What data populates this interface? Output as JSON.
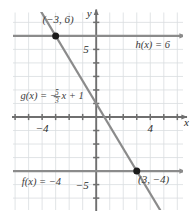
{
  "figure": {
    "axis_labels": {
      "x": "x",
      "y": "y"
    },
    "x_ticks": [
      {
        "value": -4,
        "label": "−4"
      },
      {
        "value": 4,
        "label": "4"
      }
    ],
    "y_ticks": [
      {
        "value": 5,
        "label": "5"
      },
      {
        "value": -5,
        "label": "−5"
      }
    ],
    "colors": {
      "grid": "#d9dde0",
      "axis": "#6f6f6f",
      "line": "#8b8b8b",
      "point": "#1b1b1b",
      "label": "#3a3a3a"
    }
  },
  "chart_data": {
    "type": "line",
    "title": "",
    "xlabel": "x",
    "ylabel": "y",
    "xlim": [
      -6.2,
      6.5
    ],
    "ylim": [
      -7.4,
      7.7
    ],
    "grid": true,
    "legend": "inline-annotations",
    "series": [
      {
        "name": "h",
        "label": "h(x) = 6",
        "expression": "h(x) = 6",
        "kind": "horizontal-line",
        "slope": 0,
        "intercept": 6,
        "arrows": "both",
        "label_position": {
          "x": 2.9,
          "y": 5.1
        }
      },
      {
        "name": "g",
        "label": "g(x) = -5/3 x + 1",
        "expression_parts": {
          "prefix": "g(x) = −",
          "numerator": "5",
          "denominator": "3",
          "suffix": "x + 1"
        },
        "kind": "oblique-line",
        "slope": -1.6666667,
        "intercept": 1,
        "arrows": "both",
        "label_position": {
          "x": -5.6,
          "y": 1.35
        }
      },
      {
        "name": "f",
        "label": "f(x) = -4",
        "expression": "f(x) = −4",
        "kind": "horizontal-line",
        "slope": 0,
        "intercept": -4,
        "arrows": "both",
        "label_position": {
          "x": -5.5,
          "y": -5.0
        }
      }
    ],
    "points": [
      {
        "x": -3,
        "y": 6,
        "label": "(−3, 6)",
        "label_dx": -2.55,
        "label_dy": -1.25
      },
      {
        "x": 3,
        "y": -4,
        "label": "(3, −4)",
        "label_dx": 0.25,
        "label_dy": 1.2
      }
    ]
  }
}
